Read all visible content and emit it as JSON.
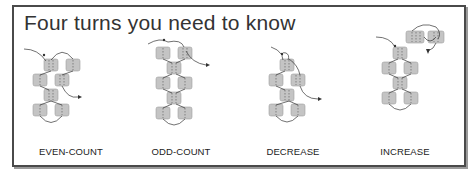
{
  "title": "Four turns you need to know",
  "colors": {
    "bead": "#c4c4c4",
    "bead_stroke": "#9e9e9e",
    "thread": "#333333",
    "frame": "#4a4a4a"
  },
  "panels": [
    {
      "label": "EVEN-COUNT"
    },
    {
      "label": "ODD-COUNT"
    },
    {
      "label": "DECREASE"
    },
    {
      "label": "INCREASE"
    }
  ]
}
